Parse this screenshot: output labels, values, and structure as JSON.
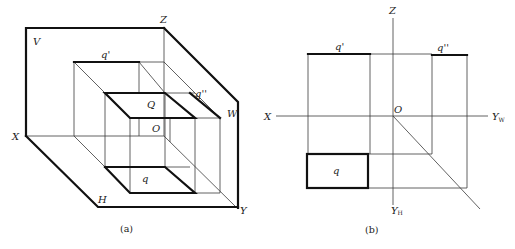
{
  "figure_a": {
    "caption": "(a)",
    "labels": {
      "V": "V",
      "Z": "Z",
      "q_prime": "q'",
      "q_double_prime": "q''",
      "Q": "Q",
      "O": "O",
      "W": "W",
      "X": "X",
      "q": "q",
      "H": "H",
      "Y": "Y"
    }
  },
  "figure_b": {
    "caption": "(b)",
    "labels": {
      "Z": "Z",
      "q_prime": "q'",
      "q_double_prime": "q''",
      "X": "X",
      "O": "O",
      "Y_W": "Y",
      "Y_W_sub": "W",
      "q": "q",
      "Y_H": "Y",
      "Y_H_sub": "H"
    }
  },
  "colors": {
    "line": "#111111",
    "thin_line": "#3a3a3a",
    "background": "#ffffff"
  }
}
